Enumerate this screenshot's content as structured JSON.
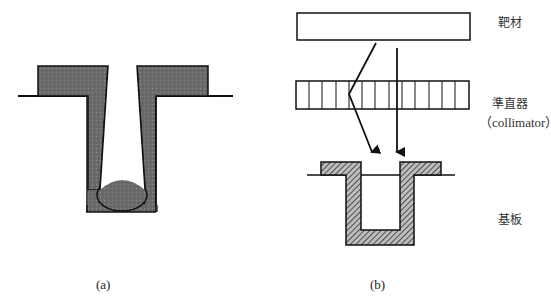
{
  "figure": {
    "panel_a": {
      "caption": "(a)",
      "description": "via/trench with overhang deposition and void at bottom"
    },
    "panel_b": {
      "caption": "(b)",
      "labels": {
        "target": "靶材",
        "collimator_cn": "準直器",
        "collimator_en": "（collimator）",
        "substrate": "基板"
      },
      "collimator_cells": 13
    },
    "colors": {
      "fill_dark": "#6a6a6a",
      "stroke": "#111111",
      "hatch": "#444444",
      "background": "#ffffff"
    }
  }
}
